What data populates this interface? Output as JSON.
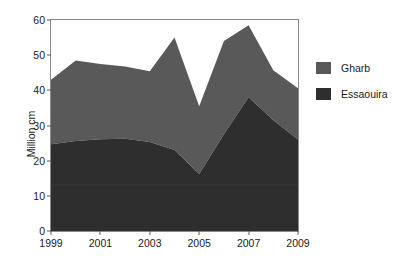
{
  "chart_data": {
    "type": "area",
    "stacked": true,
    "title": "",
    "subtitle": "",
    "xlabel": "",
    "ylabel": "Million cm",
    "xlim": [
      1999,
      2009
    ],
    "ylim": [
      0,
      60
    ],
    "grid": false,
    "legend_position": "right",
    "x": [
      1999,
      2000,
      2001,
      2002,
      2003,
      2004,
      2005,
      2006,
      2007,
      2008,
      2009
    ],
    "x_tick_labels": [
      "1999",
      "2001",
      "2003",
      "2005",
      "2007",
      "2009"
    ],
    "x_ticks": [
      1999,
      2001,
      2003,
      2005,
      2007,
      2009
    ],
    "y_ticks": [
      0,
      10,
      20,
      30,
      40,
      50,
      60
    ],
    "y_tick_labels": [
      "0",
      "10",
      "20",
      "30",
      "40",
      "50",
      "60"
    ],
    "series": [
      {
        "name": "Essaouira",
        "color": "#2e2e2e",
        "values": [
          24.7,
          25.6,
          26.1,
          26.2,
          25.3,
          23.0,
          16.2,
          27.5,
          38.0,
          31.5,
          26.0
        ]
      },
      {
        "name": "Gharb",
        "color": "#595959",
        "values": [
          18.3,
          22.9,
          21.4,
          20.6,
          20.1,
          32.0,
          19.3,
          26.5,
          20.5,
          14.2,
          14.6
        ]
      }
    ],
    "series_totals": [
      43.0,
      48.5,
      47.5,
      46.8,
      45.4,
      55.0,
      35.5,
      54.0,
      58.5,
      45.7,
      40.6
    ],
    "legend": [
      {
        "label": "Gharb",
        "color": "#595959"
      },
      {
        "label": "Essaouira",
        "color": "#2e2e2e"
      }
    ]
  },
  "axes": {
    "y_title": "Million cm"
  }
}
